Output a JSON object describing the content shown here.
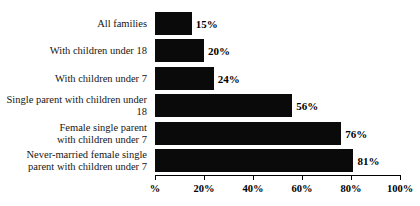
{
  "chart_data": {
    "type": "bar",
    "orientation": "horizontal",
    "title": "",
    "xlabel": "",
    "ylabel": "",
    "xlim": [
      0,
      100
    ],
    "grid": false,
    "legend": null,
    "categories": [
      "All families",
      "With children under 18",
      "With children under 7",
      "Single parent with children under 18",
      "Female single parent\nwith children under 7",
      "Never-married female single\nparent with children under 7"
    ],
    "values": [
      15,
      20,
      24,
      56,
      76,
      81
    ],
    "value_labels": [
      "15%",
      "20%",
      "24%",
      "56%",
      "76%",
      "81%"
    ],
    "xticks": [
      0,
      20,
      40,
      60,
      80,
      100
    ],
    "xtick_labels": [
      "%",
      "20%",
      "40%",
      "60%",
      "80%",
      "100%"
    ],
    "colors": {
      "bar": "#0a0a0a",
      "background": "#ffffff",
      "axis": "#000000",
      "text": "#161616"
    }
  }
}
